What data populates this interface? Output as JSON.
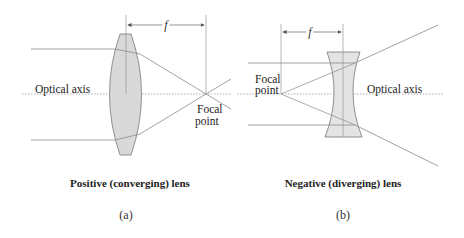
{
  "panels": [
    {
      "id": "a",
      "title": "Positive (converging) lens",
      "sublabel": "(a)",
      "axis_label": "Optical axis",
      "focal_label_line1": "Focal",
      "focal_label_line2": "point",
      "focal_length_symbol": "f"
    },
    {
      "id": "b",
      "title": "Negative (diverging) lens",
      "sublabel": "(b)",
      "axis_label": "Optical axis",
      "focal_label_line1": "Focal",
      "focal_label_line2": "point",
      "focal_length_symbol": "f"
    }
  ],
  "colors": {
    "lens_fill": "#d9d9d9",
    "lens_stroke": "#777777",
    "ray": "#8a8a8a",
    "axis": "#9a9a9a",
    "text": "#222222"
  }
}
